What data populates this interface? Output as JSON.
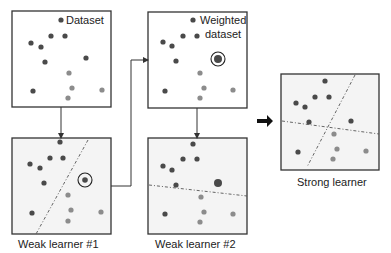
{
  "colors": {
    "dark": "#4a4a4a",
    "light": "#8c8c8c",
    "box_fill": "#f4f4f4",
    "stroke": "#333333"
  },
  "panels": [
    {
      "id": "dataset",
      "label": "Dataset",
      "label_pos": "inside",
      "box": [
        12,
        11,
        99,
        96
      ],
      "fill": "#ffffff",
      "dots": [
        [
          61,
          20,
          "d"
        ],
        [
          51,
          36,
          "d"
        ],
        [
          65,
          36,
          "d"
        ],
        [
          31,
          43,
          "d"
        ],
        [
          41,
          47,
          "d"
        ],
        [
          45,
          62,
          "d"
        ],
        [
          86,
          58,
          "d"
        ],
        [
          69,
          73,
          "l"
        ],
        [
          72,
          88,
          "l"
        ],
        [
          102,
          90,
          "l"
        ],
        [
          33,
          91,
          "d"
        ],
        [
          68,
          98,
          "l"
        ]
      ],
      "lines": []
    },
    {
      "id": "weighted",
      "label": "Weighted dataset",
      "label_lines": [
        "Weighted",
        "dataset"
      ],
      "label_pos": "inside",
      "box": [
        148,
        12,
        99,
        96
      ],
      "fill": "#ffffff",
      "dots": [
        [
          193,
          20,
          "d"
        ],
        [
          183,
          36,
          "d"
        ],
        [
          197,
          36,
          "d"
        ],
        [
          163,
          42,
          "d"
        ],
        [
          172,
          46,
          "d"
        ],
        [
          176,
          61,
          "d"
        ],
        [
          200,
          73,
          "l"
        ],
        [
          204,
          88,
          "l"
        ],
        [
          233,
          90,
          "l"
        ],
        [
          165,
          91,
          "d"
        ],
        [
          200,
          98,
          "l"
        ]
      ],
      "weighted": [
        218,
        59
      ],
      "circled": [
        218,
        59
      ],
      "lines": []
    },
    {
      "id": "weak1",
      "label": "Weak learner #1",
      "label_pos": "below",
      "box": [
        12,
        138,
        99,
        96
      ],
      "fill": "#f4f4f4",
      "dots": [
        [
          60,
          142,
          "d"
        ],
        [
          50,
          158,
          "d"
        ],
        [
          63,
          158,
          "d"
        ],
        [
          30,
          164,
          "d"
        ],
        [
          40,
          168,
          "d"
        ],
        [
          44,
          183,
          "d"
        ],
        [
          68,
          195,
          "l"
        ],
        [
          71,
          210,
          "l"
        ],
        [
          101,
          212,
          "l"
        ],
        [
          32,
          213,
          "d"
        ],
        [
          68,
          221,
          "l"
        ]
      ],
      "circled": [
        85,
        180
      ],
      "circled_dot": [
        85,
        180,
        "d"
      ],
      "lines": [
        [
          88,
          140,
          36,
          234
        ]
      ]
    },
    {
      "id": "weak2",
      "label": "Weak learner #2",
      "label_pos": "below",
      "box": [
        148,
        138,
        99,
        96
      ],
      "fill": "#f4f4f4",
      "dots": [
        [
          193,
          144,
          "d"
        ],
        [
          183,
          159,
          "d"
        ],
        [
          197,
          159,
          "d"
        ],
        [
          163,
          166,
          "d"
        ],
        [
          172,
          170,
          "d"
        ],
        [
          176,
          185,
          "d"
        ],
        [
          201,
          197,
          "l"
        ],
        [
          204,
          212,
          "l"
        ],
        [
          233,
          214,
          "l"
        ],
        [
          165,
          214,
          "d"
        ],
        [
          200,
          222,
          "l"
        ]
      ],
      "weighted": [
        218,
        183
      ],
      "lines": [
        [
          149,
          185,
          247,
          196
        ]
      ]
    },
    {
      "id": "strong",
      "label": "Strong learner",
      "label_pos": "below",
      "box": [
        281,
        74,
        98,
        96
      ],
      "fill": "#f4f4f4",
      "dots": [
        [
          325,
          81,
          "d"
        ],
        [
          315,
          97,
          "d"
        ],
        [
          329,
          97,
          "d"
        ],
        [
          296,
          103,
          "d"
        ],
        [
          305,
          107,
          "d"
        ],
        [
          309,
          122,
          "d"
        ],
        [
          351,
          121,
          "d"
        ],
        [
          334,
          134,
          "l"
        ],
        [
          337,
          149,
          "l"
        ],
        [
          366,
          151,
          "l"
        ],
        [
          298,
          152,
          "d"
        ],
        [
          333,
          159,
          "l"
        ]
      ],
      "lines": [
        [
          355,
          75,
          307,
          167
        ],
        [
          282,
          121,
          379,
          134
        ]
      ]
    }
  ],
  "labels": {
    "dataset": "Dataset",
    "weighted_1": "Weighted",
    "weighted_2": "dataset",
    "weak1": "Weak learner #1",
    "weak2": "Weak learner #2",
    "strong": "Strong learner"
  },
  "arrows": {
    "down1": [
      61,
      107,
      61,
      138
    ],
    "loop": [
      [
        111,
        186
      ],
      [
        131,
        186
      ],
      [
        131,
        60
      ],
      [
        148,
        60
      ]
    ],
    "down2": [
      197,
      108,
      197,
      138
    ],
    "big_arrow": [
      257,
      121,
      273,
      121
    ]
  }
}
